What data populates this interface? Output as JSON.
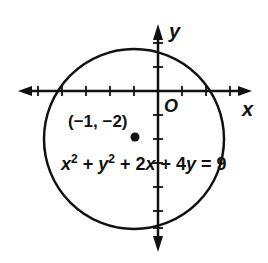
{
  "diagram": {
    "axes": {
      "x_label": "x",
      "y_label": "y",
      "origin_label": "O",
      "unit_px": 24,
      "origin_px": [
        158,
        91
      ]
    },
    "circle": {
      "center": [
        -1,
        -2
      ],
      "radius_units": 3.74,
      "equation_parts": {
        "t1": "x",
        "s1": "2",
        "plus1": " + ",
        "t2": "y",
        "s2": "2",
        "plus2": " + 2",
        "t3": "x",
        "plus3": " + 4",
        "t4": "y",
        "eq": " = 9"
      },
      "equation_text": "x² + y² + 2x + 4y = 9"
    },
    "center_point": {
      "label": "(−1, −2)"
    },
    "colors": {
      "stroke": "#111111",
      "background": "#ffffff"
    }
  }
}
